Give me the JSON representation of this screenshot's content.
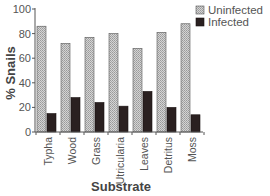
{
  "chart_data": {
    "type": "bar",
    "title": "",
    "xlabel": "Substrate",
    "ylabel": "% Snails",
    "ylim": [
      0,
      100
    ],
    "yticks": [
      0,
      20,
      40,
      60,
      80,
      100
    ],
    "grid": false,
    "legend_position": "top-right",
    "categories": [
      "Typha",
      "Wood",
      "Grass",
      "Utricularia",
      "Leaves",
      "Detritus",
      "Moss"
    ],
    "series": [
      {
        "name": "Uninfected",
        "color": "#c8c8c8",
        "pattern": "stipple",
        "values": [
          86,
          72,
          77,
          80,
          68,
          81,
          88
        ]
      },
      {
        "name": "Infected",
        "color": "#2a2020",
        "pattern": "solid",
        "values": [
          15,
          28,
          24,
          21,
          33,
          20,
          14
        ]
      }
    ]
  }
}
